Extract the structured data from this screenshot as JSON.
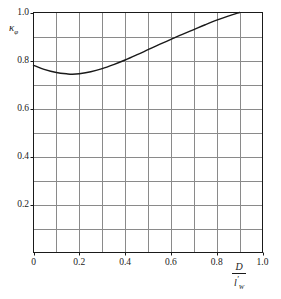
{
  "chart_data": {
    "type": "line",
    "title": "",
    "xlabel": "D / l'_W",
    "ylabel": "kappa_phi",
    "xlim": [
      0.0,
      1.0
    ],
    "ylim": [
      0.0,
      1.0
    ],
    "grid": true,
    "legend": "none",
    "x_ticks": [
      "0",
      "0.2",
      "0.4",
      "0.6",
      "0.8",
      "1.0"
    ],
    "x_tick_values": [
      0.0,
      0.2,
      0.4,
      0.6,
      0.8,
      1.0
    ],
    "y_ticks": [
      "0.2",
      "0.4",
      "0.6",
      "0.8",
      "1.0"
    ],
    "y_tick_values": [
      0.2,
      0.4,
      0.6,
      0.8,
      1.0
    ],
    "x_minor_step": 0.1,
    "y_minor_step": 0.1,
    "line_color": "#1a1a1a",
    "grid_color": "#8a8a8a",
    "axis_color": "#1a1a1a",
    "series": [
      {
        "name": "kappa_phi",
        "x": [
          0.0,
          0.05,
          0.1,
          0.15,
          0.17,
          0.2,
          0.25,
          0.3,
          0.35,
          0.4,
          0.45,
          0.5,
          0.55,
          0.6,
          0.65,
          0.7,
          0.75,
          0.8,
          0.85,
          0.9
        ],
        "values": [
          0.78,
          0.762,
          0.75,
          0.744,
          0.743,
          0.745,
          0.753,
          0.766,
          0.783,
          0.802,
          0.823,
          0.845,
          0.867,
          0.888,
          0.909,
          0.929,
          0.949,
          0.968,
          0.985,
          1.0
        ]
      }
    ],
    "annotations": []
  },
  "axis_titles": {
    "y_symbol": "κ",
    "y_subscript": "φ",
    "x_numerator": "D",
    "x_denominator_base": "l",
    "x_denominator_prime": "′",
    "x_denominator_subscript": "W"
  }
}
